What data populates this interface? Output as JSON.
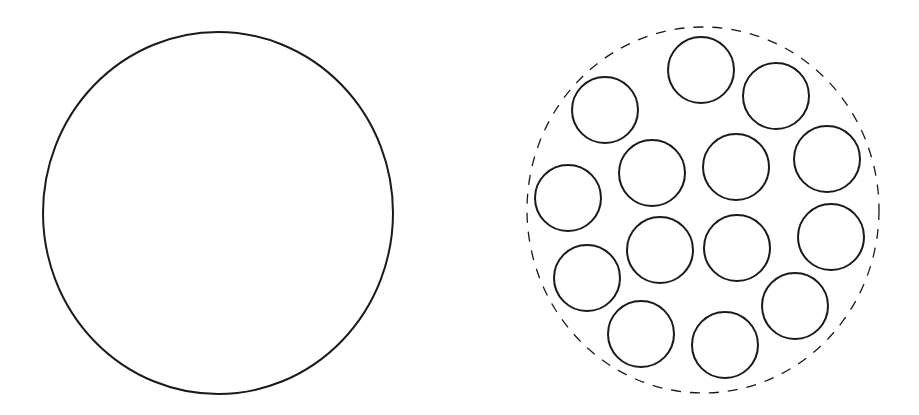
{
  "diagram": {
    "stroke_color": "#1a1a1a",
    "background": "#ffffff",
    "single_circle": {
      "cx": 218,
      "cy": 213,
      "rx": 175,
      "ry": 181,
      "stroke_width": 2
    },
    "bundle": {
      "outline": {
        "cx": 703,
        "cy": 210,
        "rx": 176,
        "ry": 183,
        "stroke_width": 1.3,
        "dash": "10 9",
        "style": "dashed"
      },
      "small_circle_radius": 33,
      "small_circle_stroke_width": 2,
      "circles": [
        {
          "cx": 701,
          "cy": 70
        },
        {
          "cx": 776,
          "cy": 96
        },
        {
          "cx": 605,
          "cy": 110
        },
        {
          "cx": 652,
          "cy": 173
        },
        {
          "cx": 736,
          "cy": 167
        },
        {
          "cx": 827,
          "cy": 159
        },
        {
          "cx": 568,
          "cy": 198
        },
        {
          "cx": 660,
          "cy": 250
        },
        {
          "cx": 737,
          "cy": 248
        },
        {
          "cx": 831,
          "cy": 237
        },
        {
          "cx": 587,
          "cy": 278
        },
        {
          "cx": 795,
          "cy": 306
        },
        {
          "cx": 641,
          "cy": 334
        },
        {
          "cx": 725,
          "cy": 345
        }
      ]
    }
  }
}
